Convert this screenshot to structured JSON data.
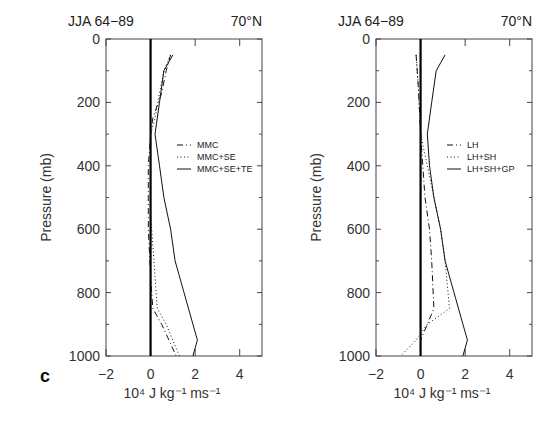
{
  "panel_label": "c",
  "chart_data": [
    {
      "type": "line",
      "title_left": "JJA 64−89",
      "title_right": "70°N",
      "xlabel": "10⁴ J kg⁻¹ ms⁻¹",
      "ylabel": "Pressure (mb)",
      "xlim": [
        -2,
        5
      ],
      "ylim": [
        1000,
        0
      ],
      "xticks": [
        -2,
        0,
        2,
        4
      ],
      "yticks": [
        0,
        200,
        400,
        600,
        800,
        1000
      ],
      "grid": false,
      "legend_position": "right-middle",
      "zero_line": true,
      "series": [
        {
          "name": "MMC",
          "style": "dashdot",
          "points": [
            [
              0.9,
              50
            ],
            [
              0.7,
              100
            ],
            [
              0.5,
              170
            ],
            [
              0.1,
              250
            ],
            [
              0.0,
              300
            ],
            [
              -0.1,
              400
            ],
            [
              -0.1,
              500
            ],
            [
              -0.1,
              600
            ],
            [
              0.0,
              750
            ],
            [
              0.1,
              850
            ],
            [
              0.5,
              900
            ],
            [
              1.15,
              1000
            ]
          ]
        },
        {
          "name": "MMC+SE",
          "style": "dotted",
          "points": [
            [
              0.9,
              50
            ],
            [
              0.6,
              100
            ],
            [
              0.4,
              170
            ],
            [
              0.2,
              250
            ],
            [
              0.0,
              300
            ],
            [
              0.0,
              400
            ],
            [
              0.0,
              550
            ],
            [
              0.1,
              650
            ],
            [
              0.2,
              750
            ],
            [
              0.3,
              850
            ],
            [
              0.7,
              900
            ],
            [
              1.3,
              1000
            ]
          ]
        },
        {
          "name": "MMC+SE+TE",
          "style": "solid",
          "points": [
            [
              1.0,
              50
            ],
            [
              0.6,
              100
            ],
            [
              0.4,
              200
            ],
            [
              0.2,
              300
            ],
            [
              0.4,
              400
            ],
            [
              0.6,
              500
            ],
            [
              0.9,
              600
            ],
            [
              1.1,
              700
            ],
            [
              1.5,
              800
            ],
            [
              2.1,
              950
            ],
            [
              1.9,
              1000
            ]
          ]
        }
      ]
    },
    {
      "type": "line",
      "title_left": "JJA 64−89",
      "title_right": "70°N",
      "xlabel": "10⁴ J kg⁻¹ ms⁻¹",
      "ylabel": "Pressure (mb)",
      "xlim": [
        -2,
        5
      ],
      "ylim": [
        1000,
        0
      ],
      "xticks": [
        -2,
        0,
        2,
        4
      ],
      "yticks": [
        0,
        200,
        400,
        600,
        800,
        1000
      ],
      "grid": false,
      "legend_position": "right-middle",
      "zero_line": true,
      "series": [
        {
          "name": "LH",
          "style": "dashdot",
          "points": [
            [
              -0.2,
              50
            ],
            [
              -0.1,
              150
            ],
            [
              0.0,
              300
            ],
            [
              0.1,
              400
            ],
            [
              0.2,
              500
            ],
            [
              0.4,
              600
            ],
            [
              0.5,
              700
            ],
            [
              0.6,
              850
            ],
            [
              0.3,
              900
            ],
            [
              0.0,
              950
            ]
          ]
        },
        {
          "name": "LH+SH",
          "style": "dotted",
          "points": [
            [
              -0.2,
              50
            ],
            [
              -0.1,
              150
            ],
            [
              0.0,
              300
            ],
            [
              0.3,
              400
            ],
            [
              0.6,
              500
            ],
            [
              0.9,
              600
            ],
            [
              1.1,
              700
            ],
            [
              1.3,
              850
            ],
            [
              0.3,
              900
            ],
            [
              -0.2,
              950
            ],
            [
              -0.9,
              1000
            ]
          ]
        },
        {
          "name": "LH+SH+GP",
          "style": "solid",
          "points": [
            [
              1.1,
              50
            ],
            [
              0.7,
              100
            ],
            [
              0.5,
              200
            ],
            [
              0.3,
              300
            ],
            [
              0.4,
              400
            ],
            [
              0.6,
              500
            ],
            [
              0.9,
              600
            ],
            [
              1.1,
              700
            ],
            [
              1.5,
              800
            ],
            [
              2.1,
              950
            ],
            [
              1.9,
              1000
            ]
          ]
        }
      ]
    }
  ]
}
